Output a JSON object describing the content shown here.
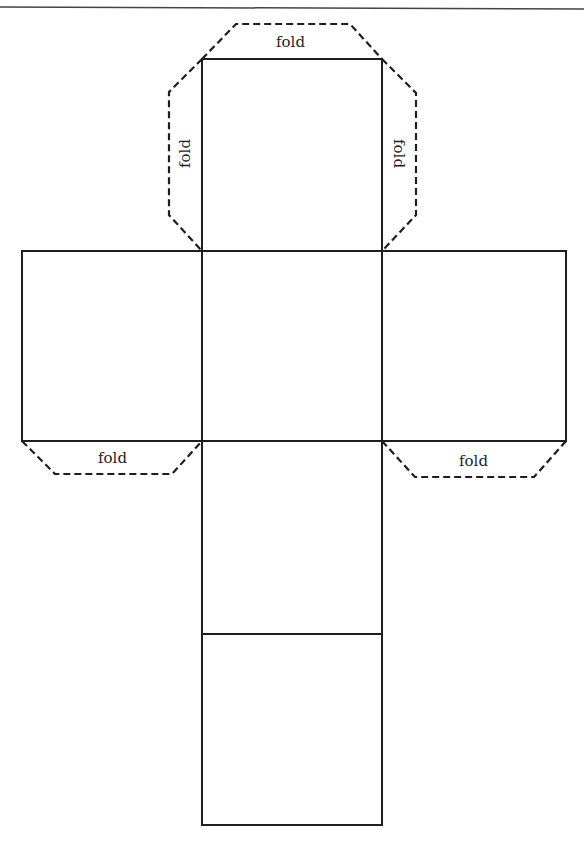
{
  "diagram": {
    "title": "",
    "type": "cube-net",
    "colors": {
      "line": "#1e1e1e",
      "background": "#ffffff"
    },
    "faces": [
      {
        "id": "top",
        "x": 202,
        "y": 59,
        "w": 180,
        "h": 192
      },
      {
        "id": "left",
        "x": 22,
        "y": 251,
        "w": 180,
        "h": 190
      },
      {
        "id": "center",
        "x": 202,
        "y": 251,
        "w": 180,
        "h": 190
      },
      {
        "id": "right",
        "x": 382,
        "y": 251,
        "w": 184,
        "h": 190
      },
      {
        "id": "lower",
        "x": 202,
        "y": 441,
        "w": 180,
        "h": 193
      },
      {
        "id": "bottom",
        "x": 202,
        "y": 634,
        "w": 180,
        "h": 191
      }
    ],
    "fold_tabs": [
      {
        "id": "tab-top",
        "label": "fold"
      },
      {
        "id": "tab-top-left",
        "label": "fold"
      },
      {
        "id": "tab-top-right",
        "label": "fold"
      },
      {
        "id": "tab-bottom-left",
        "label": "fold"
      },
      {
        "id": "tab-bottom-right",
        "label": "fold"
      }
    ]
  }
}
